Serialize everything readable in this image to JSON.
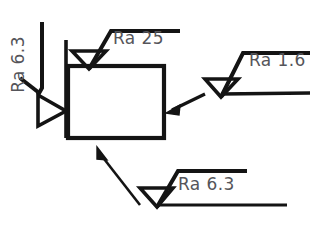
{
  "drawing": {
    "title": "Surface roughness symbol callouts on rectangular part",
    "stroke_color": "#141414",
    "text_color": "#55555a",
    "background": "#ffffff",
    "part": {
      "shape": "rectangle",
      "x": 68,
      "y": 66,
      "width": 96,
      "height": 72
    },
    "callouts": [
      {
        "id": "top",
        "label": "Ra 25",
        "value": "25",
        "parameter": "Ra",
        "position": "top",
        "symbol": "surface-finish-triangle",
        "leader": "horizontal-shelf-right"
      },
      {
        "id": "right",
        "label": "Ra 1.6",
        "value": "1.6",
        "parameter": "Ra",
        "position": "right",
        "symbol": "surface-finish-triangle",
        "leader": "arrow-to-right-edge"
      },
      {
        "id": "left",
        "label": "Ra 6.3",
        "value": "6.3",
        "parameter": "Ra",
        "position": "left",
        "orientation": "rotated-90-ccw",
        "symbol": "surface-finish-triangle-rotated",
        "leader": "bent-to-left-edge"
      },
      {
        "id": "bottom",
        "label": "Ra 6.3",
        "value": "6.3",
        "parameter": "Ra",
        "position": "bottom",
        "symbol": "surface-finish-triangle",
        "leader": "diagonal-arrow-to-bottom-edge"
      }
    ]
  }
}
